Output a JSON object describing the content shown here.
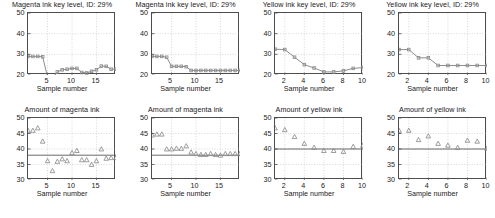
{
  "figure": {
    "background": "#ffffff",
    "line_color": "#808080",
    "marker_color": "#8c8c8c",
    "axis_color": "#4d4d4d",
    "grid_color": "#b3b3b3",
    "text_color": "#1a1a1a",
    "rows": 2,
    "cols": 4
  },
  "chart_data": [
    {
      "id": "magenta-key-level-1",
      "type": "line",
      "title": "Magenta ink key level, ID:  29%",
      "xlabel": "Sample number",
      "ylabel": "",
      "xlim": [
        1,
        19
      ],
      "ylim": [
        20,
        50
      ],
      "xticks": [
        5,
        10,
        15
      ],
      "yticks": [
        20,
        30,
        40,
        50
      ],
      "grid": true,
      "marker": "square",
      "x": [
        1,
        2,
        3,
        4,
        5,
        6,
        7,
        8,
        9,
        10,
        11,
        12,
        13,
        14,
        15,
        16,
        17,
        18,
        19
      ],
      "values": [
        29.0,
        29.0,
        29.0,
        28.8,
        19.0,
        18.3,
        21.5,
        22.5,
        22.8,
        23.2,
        23.2,
        21.2,
        21.0,
        21.8,
        22.5,
        24.3,
        24.2,
        22.8,
        22.8
      ]
    },
    {
      "id": "magenta-key-level-2",
      "type": "line",
      "title": "Magenta ink key level, ID:  29%",
      "xlabel": "Sample number",
      "ylabel": "",
      "xlim": [
        1,
        19
      ],
      "ylim": [
        20,
        50
      ],
      "xticks": [
        5,
        10,
        15
      ],
      "yticks": [
        20,
        30,
        40,
        50
      ],
      "grid": true,
      "marker": "square",
      "x": [
        1,
        2,
        3,
        4,
        5,
        6,
        7,
        8,
        9,
        10,
        11,
        12,
        13,
        14,
        15,
        16,
        17,
        18,
        19
      ],
      "values": [
        29.0,
        29.0,
        29.0,
        28.6,
        24.2,
        24.2,
        24.2,
        24.0,
        22.2,
        22.2,
        22.2,
        22.2,
        22.2,
        22.2,
        22.2,
        22.2,
        22.2,
        22.2,
        22.2
      ]
    },
    {
      "id": "yellow-key-level-1",
      "type": "line",
      "title": "Yellow ink key level, ID:  29%",
      "xlabel": "Sample number",
      "ylabel": "",
      "xlim": [
        1,
        10
      ],
      "ylim": [
        20,
        50
      ],
      "xticks": [
        2,
        4,
        6,
        8,
        10
      ],
      "yticks": [
        20,
        30,
        40,
        50
      ],
      "grid": true,
      "marker": "square",
      "x": [
        1,
        2,
        3,
        4,
        5,
        6,
        7,
        8,
        9,
        10
      ],
      "values": [
        32.5,
        32.3,
        28.6,
        25.0,
        23.4,
        21.5,
        21.5,
        22.0,
        23.2,
        23.6
      ]
    },
    {
      "id": "yellow-key-level-2",
      "type": "line",
      "title": "Yellow ink key level, ID:  29%",
      "xlabel": "Sample number",
      "ylabel": "",
      "xlim": [
        1,
        10
      ],
      "ylim": [
        20,
        50
      ],
      "xticks": [
        2,
        4,
        6,
        8,
        10
      ],
      "yticks": [
        20,
        30,
        40,
        50
      ],
      "grid": true,
      "marker": "square",
      "x": [
        1,
        2,
        3,
        4,
        5,
        6,
        7,
        8,
        9,
        10
      ],
      "values": [
        32.3,
        32.3,
        28.3,
        28.3,
        24.6,
        24.6,
        24.6,
        24.6,
        24.6,
        24.6
      ]
    },
    {
      "id": "magenta-amount-1",
      "type": "scatter",
      "title": "Amount of magenta ink",
      "xlabel": "Sample number",
      "ylabel": "",
      "xlim": [
        1,
        19
      ],
      "ylim": [
        30,
        50
      ],
      "xticks": [
        5,
        10,
        15
      ],
      "yticks": [
        30,
        35,
        40,
        45,
        50
      ],
      "grid": true,
      "marker": "triangle",
      "reference_line": 38.0,
      "x": [
        1,
        2,
        3,
        4,
        5,
        6,
        7,
        8,
        9,
        10,
        11,
        12,
        13,
        14,
        15,
        16,
        17,
        18,
        19
      ],
      "values": [
        46.0,
        46.0,
        46.8,
        42.5,
        36.2,
        33.0,
        36.0,
        36.8,
        36.2,
        38.8,
        39.5,
        36.5,
        36.5,
        35.0,
        36.2,
        40.0,
        37.0,
        37.2,
        37.2
      ]
    },
    {
      "id": "magenta-amount-2",
      "type": "scatter",
      "title": "Amount of magenta ink",
      "xlabel": "Sample number",
      "ylabel": "",
      "xlim": [
        1,
        19
      ],
      "ylim": [
        30,
        50
      ],
      "xticks": [
        5,
        10,
        15
      ],
      "yticks": [
        30,
        35,
        40,
        45,
        50
      ],
      "grid": true,
      "marker": "triangle",
      "reference_line": 38.0,
      "x": [
        1,
        2,
        3,
        4,
        5,
        6,
        7,
        8,
        9,
        10,
        11,
        12,
        13,
        14,
        15,
        16,
        17,
        18,
        19
      ],
      "values": [
        44.5,
        44.8,
        44.8,
        40.0,
        40.0,
        40.2,
        40.2,
        41.0,
        39.0,
        38.5,
        38.2,
        38.2,
        38.5,
        38.2,
        38.0,
        38.5,
        38.5,
        38.5,
        38.5
      ]
    },
    {
      "id": "yellow-amount-1",
      "type": "scatter",
      "title": "Amount of yellow ink",
      "xlabel": "Sample number",
      "ylabel": "",
      "xlim": [
        1,
        10
      ],
      "ylim": [
        30,
        50
      ],
      "xticks": [
        2,
        4,
        6,
        8,
        10
      ],
      "yticks": [
        30,
        35,
        40,
        45,
        50
      ],
      "grid": true,
      "marker": "triangle",
      "reference_line": 40.0,
      "x": [
        1,
        2,
        3,
        4,
        5,
        6,
        7,
        8,
        9,
        10
      ],
      "values": [
        46.8,
        46.2,
        44.0,
        41.8,
        40.5,
        39.5,
        39.5,
        39.2,
        40.8,
        41.2
      ]
    },
    {
      "id": "yellow-amount-2",
      "type": "scatter",
      "title": "Amount of yellow ink",
      "xlabel": "Sample number",
      "ylabel": "",
      "xlim": [
        1,
        10
      ],
      "ylim": [
        30,
        50
      ],
      "xticks": [
        2,
        4,
        6,
        8,
        10
      ],
      "yticks": [
        30,
        35,
        40,
        45,
        50
      ],
      "grid": true,
      "marker": "triangle",
      "reference_line": 40.0,
      "x": [
        1,
        2,
        3,
        4,
        5,
        6,
        7,
        8,
        9,
        10
      ],
      "values": [
        46.0,
        46.0,
        43.0,
        44.2,
        41.8,
        41.2,
        40.5,
        42.8,
        42.5,
        40.2
      ]
    }
  ]
}
